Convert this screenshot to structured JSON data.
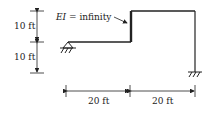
{
  "diagram": {
    "type": "structural-frame",
    "annotation": {
      "prefix": "EI",
      "text": " = infinity"
    },
    "dimensions": {
      "vertical": [
        {
          "label": "10 ft"
        },
        {
          "label": "10 ft"
        }
      ],
      "horizontal": [
        {
          "label": "20 ft"
        },
        {
          "label": "20 ft"
        }
      ]
    },
    "supports": {
      "left": "pin-support-icon",
      "right": "fixed-support-icon"
    },
    "colors": {
      "line": "#222222",
      "background": "#ffffff"
    }
  }
}
